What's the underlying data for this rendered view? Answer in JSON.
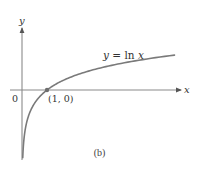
{
  "chart_data": {
    "type": "line",
    "title": "",
    "xlabel": "x",
    "ylabel": "y",
    "function": "y = ln x",
    "series": [
      {
        "name": "y = ln x",
        "x": [
          0.03,
          0.05,
          0.1,
          0.2,
          0.3,
          0.5,
          0.7,
          1,
          1.5,
          2,
          3,
          4,
          5,
          6.1
        ],
        "values": [
          -3.51,
          -3.0,
          -2.3,
          -1.61,
          -1.2,
          -0.69,
          -0.36,
          0,
          0.41,
          0.69,
          1.1,
          1.39,
          1.61,
          1.81
        ]
      }
    ],
    "annotations": [
      {
        "text": "(1, 0)",
        "x": 1,
        "y": 0,
        "marker": "dot"
      },
      {
        "text": "y = ln x",
        "position": "above curve, right side"
      }
    ],
    "origin_label": "0",
    "xlim": [
      -0.9,
      6.5
    ],
    "ylim": [
      -3.6,
      3.2
    ],
    "grid": false,
    "legend": "none",
    "caption": "(b)"
  },
  "labels": {
    "x_axis": "x",
    "y_axis": "y",
    "origin": "0",
    "point": "(1, 0)",
    "curve": "y = ln x",
    "caption": "(b)"
  },
  "colors": {
    "axis": "#8a8a8a",
    "curve": "#7a7a7a",
    "point": "#6e6e6e",
    "text": "#333333"
  },
  "mapping": {
    "origin_px": [
      22,
      90
    ],
    "x_scale": 25,
    "y_scale": 19.3
  }
}
